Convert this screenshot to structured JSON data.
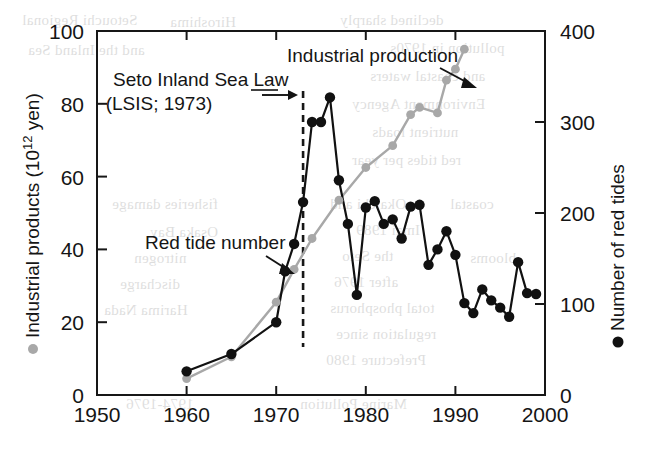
{
  "chart_data": {
    "type": "line",
    "title": "",
    "subtitle": "",
    "xlabel": "",
    "ylabel": "Industrial products (10¹² yen)",
    "y2label": "Number of red tides",
    "xlim": [
      1950,
      2000
    ],
    "ylim": [
      0,
      100
    ],
    "y2lim": [
      0,
      400
    ],
    "xticks": [
      1950,
      1960,
      1970,
      1980,
      1990,
      2000
    ],
    "xtick_labels": [
      "1950",
      "1960",
      "1970",
      "1980",
      "1990",
      "2000"
    ],
    "yticks": [
      0,
      20,
      40,
      60,
      80,
      100
    ],
    "ytick_labels": [
      "0",
      "20",
      "40",
      "60",
      "80",
      "100"
    ],
    "y2ticks": [
      0,
      100,
      200,
      300,
      400
    ],
    "y2tick_labels": [
      "0",
      "100",
      "200",
      "300",
      "400"
    ],
    "grid": false,
    "legend_position": "inline-annotations",
    "series": [
      {
        "name": "Industrial production",
        "axis": "left",
        "marker": "circle",
        "color": "#a8a8a8",
        "unit": "10^12 yen",
        "x": [
          1960,
          1965,
          1970,
          1972,
          1974,
          1977,
          1980,
          1983,
          1985,
          1986,
          1988,
          1989,
          1990,
          1991
        ],
        "values": [
          4.5,
          10.5,
          25.5,
          34.5,
          43.0,
          53.5,
          62.5,
          68.5,
          77.0,
          79.0,
          77.5,
          86.5,
          89.5,
          95.0
        ]
      },
      {
        "name": "Red tide number",
        "axis": "right",
        "marker": "circle-filled",
        "color": "#111111",
        "unit": "count",
        "x": [
          1960,
          1965,
          1970,
          1971,
          1972,
          1973,
          1974,
          1975,
          1976,
          1977,
          1978,
          1979,
          1980,
          1981,
          1982,
          1983,
          1984,
          1985,
          1986,
          1987,
          1988,
          1989,
          1990,
          1991,
          1992,
          1993,
          1994,
          1995,
          1996,
          1997,
          1998,
          1999
        ],
        "values": [
          26,
          45,
          80,
          136,
          166,
          212,
          300,
          300,
          327,
          236,
          188,
          110,
          206,
          213,
          188,
          193,
          172,
          207,
          209,
          143,
          160,
          180,
          154,
          101,
          90,
          116,
          104,
          96,
          86,
          146,
          112,
          111
        ]
      }
    ],
    "annotations": [
      {
        "name": "seto-inland-sea-law",
        "line1": "Seto Inland Sea Law",
        "line2": "(LSIS; 1973)",
        "points_to_year": 1973,
        "style": "dashed-vertical-line-with-arrow"
      },
      {
        "name": "industrial-production-label",
        "text": "Industrial production",
        "points_to_year": 1989,
        "style": "arrow"
      },
      {
        "name": "red-tide-number-label",
        "text": "Red tide number",
        "points_to_year": 1972,
        "style": "arrow"
      }
    ],
    "reference_line": {
      "year": 1973,
      "style": "dashed",
      "label": "LSIS; 1973"
    }
  },
  "ghost_text": [
    {
      "text": "Setouchi Regional",
      "x": 22,
      "y": 12
    },
    {
      "text": "and the Inland Sea",
      "x": 28,
      "y": 42
    },
    {
      "text": "Hiroshima",
      "x": 170,
      "y": 14
    },
    {
      "text": "declined sharply",
      "x": 340,
      "y": 12
    },
    {
      "text": "pollution in 1970s",
      "x": 390,
      "y": 40
    },
    {
      "text": "and coastal waters",
      "x": 370,
      "y": 68
    },
    {
      "text": "Environment Agency",
      "x": 352,
      "y": 96
    },
    {
      "text": "nutrient loads",
      "x": 372,
      "y": 124
    },
    {
      "text": "red tides per year",
      "x": 352,
      "y": 152
    },
    {
      "text": "Okaichi and",
      "x": 330,
      "y": 196
    },
    {
      "text": "Imai 1989",
      "x": 356,
      "y": 222
    },
    {
      "text": "the Seto",
      "x": 342,
      "y": 248
    },
    {
      "text": "after 1976",
      "x": 334,
      "y": 274
    },
    {
      "text": "total phosphorus",
      "x": 330,
      "y": 300
    },
    {
      "text": "regulation since",
      "x": 336,
      "y": 326
    },
    {
      "text": "Prefecture 1980",
      "x": 326,
      "y": 352
    },
    {
      "text": "fisheries damage",
      "x": 112,
      "y": 196
    },
    {
      "text": "Osaka Bay",
      "x": 150,
      "y": 224
    },
    {
      "text": "nitrogen",
      "x": 134,
      "y": 250
    },
    {
      "text": "discharge",
      "x": 120,
      "y": 276
    },
    {
      "text": "Harima Nada",
      "x": 104,
      "y": 302
    },
    {
      "text": "1974-1976",
      "x": 126,
      "y": 396
    },
    {
      "text": "Marine Pollution",
      "x": 300,
      "y": 396
    },
    {
      "text": "coastal",
      "x": 450,
      "y": 196
    },
    {
      "text": "blooms",
      "x": 470,
      "y": 250
    }
  ]
}
